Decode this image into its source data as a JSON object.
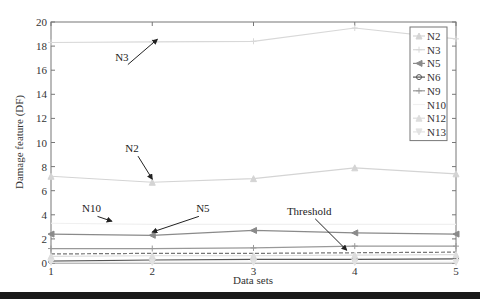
{
  "chart_data": {
    "type": "line",
    "title": "",
    "xlabel": "Data sets",
    "ylabel": "Damage feature (DF)",
    "xlim": [
      1,
      5
    ],
    "ylim": [
      0,
      20
    ],
    "x": [
      1,
      2,
      3,
      4,
      5
    ],
    "xticks": [
      "1",
      "2",
      "3",
      "4",
      "5"
    ],
    "yticks": [
      "0",
      "2",
      "4",
      "6",
      "8",
      "10",
      "12",
      "14",
      "16",
      "18",
      "20"
    ],
    "grid": false,
    "legend_position": "top-right",
    "series": [
      {
        "name": "N2",
        "values": [
          7.2,
          6.7,
          7.0,
          7.9,
          7.4
        ],
        "color": "#d4d4d4",
        "marker": "triangle-up"
      },
      {
        "name": "N3",
        "values": [
          18.3,
          18.35,
          18.4,
          19.5,
          18.6
        ],
        "color": "#d8d8d8",
        "marker": "plus"
      },
      {
        "name": "N5",
        "values": [
          2.4,
          2.3,
          2.7,
          2.5,
          2.4
        ],
        "color": "#8a8a8a",
        "marker": "triangle-left"
      },
      {
        "name": "N6",
        "values": [
          0.15,
          0.25,
          0.3,
          0.3,
          0.35
        ],
        "color": "#555555",
        "marker": "circle"
      },
      {
        "name": "N9",
        "values": [
          1.2,
          1.2,
          1.25,
          1.4,
          1.4
        ],
        "color": "#999999",
        "marker": "plus"
      },
      {
        "name": "N10",
        "values": [
          3.3,
          3.2,
          3.2,
          3.2,
          3.2
        ],
        "color": "#f0f0f0",
        "marker": "none"
      },
      {
        "name": "N12",
        "values": [
          0.55,
          0.6,
          0.6,
          0.65,
          0.7
        ],
        "color": "#dddddd",
        "marker": "triangle-up"
      },
      {
        "name": "N13",
        "values": [
          0.05,
          0.05,
          0.05,
          0.05,
          0.05
        ],
        "color": "#e2e2e2",
        "marker": "triangle-down"
      }
    ],
    "threshold": {
      "name": "Threshold",
      "values": [
        0.75,
        0.8,
        0.8,
        0.85,
        0.9
      ],
      "style": "dashed",
      "color": "#777777"
    },
    "annotations": [
      {
        "text": "N3",
        "label_at": [
          1.7,
          16.8
        ],
        "arrow_to": [
          2.05,
          18.4
        ]
      },
      {
        "text": "N2",
        "label_at": [
          1.8,
          9.2
        ],
        "arrow_to": [
          2.0,
          6.8
        ]
      },
      {
        "text": "N10",
        "label_at": [
          1.4,
          4.2
        ],
        "arrow_to": [
          1.6,
          3.3
        ]
      },
      {
        "text": "N5",
        "label_at": [
          2.5,
          4.2
        ],
        "arrow_to": [
          2.0,
          2.4
        ]
      },
      {
        "text": "Threshold",
        "label_at": [
          3.55,
          4.0
        ],
        "arrow_to": [
          3.92,
          0.9
        ]
      }
    ]
  }
}
